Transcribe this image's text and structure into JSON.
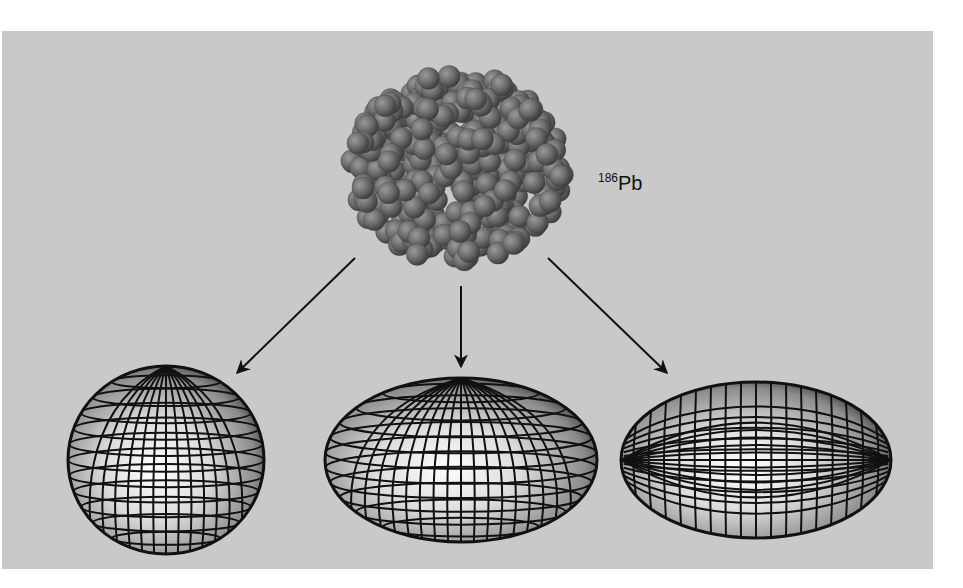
{
  "figure": {
    "background_color": "#c9c9c9",
    "panel": {
      "x": 2,
      "y": 31,
      "width": 931,
      "height": 538
    },
    "nucleus": {
      "label": {
        "mass_number": "186",
        "symbol": "Pb",
        "x": 598,
        "y": 190
      },
      "center": [
        457,
        168
      ],
      "radius": [
        116,
        104
      ],
      "nucleon_color": "#6f6f6f"
    },
    "arrows": [
      {
        "name": "arrow-to-spherical",
        "from": [
          355,
          258
        ],
        "to": [
          237,
          373
        ]
      },
      {
        "name": "arrow-to-oblate",
        "from": [
          461,
          286
        ],
        "to": [
          461,
          367
        ]
      },
      {
        "name": "arrow-to-prolate",
        "from": [
          548,
          258
        ],
        "to": [
          667,
          373
        ]
      }
    ],
    "shapes": [
      {
        "name": "spherical-shape",
        "type": "sphere",
        "cx": 166,
        "cy": 460,
        "rx": 98,
        "ry": 94,
        "meridians": 14,
        "parallels": 12
      },
      {
        "name": "oblate-shape",
        "type": "oblate",
        "cx": 461,
        "cy": 460,
        "rx": 136,
        "ry": 82,
        "meridians": 18,
        "parallels": 11
      },
      {
        "name": "prolate-shape",
        "type": "prolate",
        "cx": 756,
        "cy": 460,
        "rx": 135,
        "ry": 78,
        "meridians": 18,
        "parallels": 12
      }
    ]
  }
}
